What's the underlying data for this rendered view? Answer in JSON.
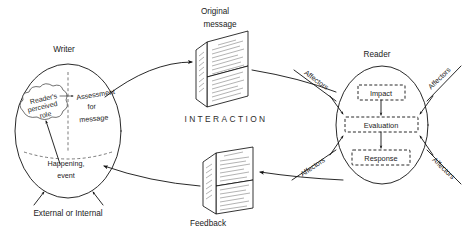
{
  "diagram": {
    "center_label": "INTERACTION",
    "colors": {
      "background": "#ffffff",
      "ink": "#111111",
      "light_ink": "#555555",
      "text": "#1b1b1b"
    }
  },
  "writer": {
    "label": "Writer",
    "cloud_line1": "Reader's",
    "cloud_line2": "perceived",
    "cloud_line3": "role",
    "assessment_line1": "Assessment",
    "assessment_line2": "for",
    "assessment_line3": "message",
    "happening_line1": "Happening,",
    "happening_line2": "event",
    "source_label": "External or Internal"
  },
  "reader": {
    "label": "Reader",
    "boxes": [
      {
        "label": "Impact"
      },
      {
        "label": "Evaluation"
      },
      {
        "label": "Response"
      }
    ],
    "affectors": [
      {
        "label": "Affectors",
        "position": "upper-left"
      },
      {
        "label": "Affectors",
        "position": "lower-left"
      },
      {
        "label": "Affectors",
        "position": "upper-right"
      },
      {
        "label": "Affectors",
        "position": "lower-right"
      }
    ]
  },
  "messages": {
    "original": {
      "line1": "Original",
      "line2": "message"
    },
    "feedback": {
      "label": "Feedback"
    }
  }
}
